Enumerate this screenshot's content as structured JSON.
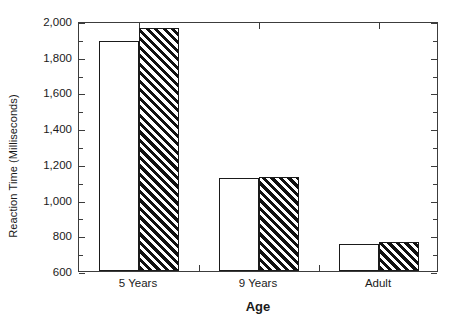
{
  "chart_data": {
    "type": "bar",
    "title": "",
    "subtitle": "",
    "xlabel": "Age",
    "ylabel": "Reaction Time (Milliseconds)",
    "categories": [
      "5 Years",
      "9 Years",
      "Adult"
    ],
    "series": [
      {
        "name": "open",
        "style": "white-open",
        "values": [
          1890,
          1120,
          750
        ]
      },
      {
        "name": "hatched",
        "style": "black-diagonal-hatch",
        "values": [
          1960,
          1125,
          765
        ]
      }
    ],
    "ylim": [
      600,
      2000
    ],
    "ytick_labels": [
      "600",
      "800",
      "1,000",
      "1,200",
      "1,400",
      "1,600",
      "1,800",
      "2,000"
    ],
    "ytick_values": [
      600,
      800,
      1000,
      1200,
      1400,
      1600,
      1800,
      2000
    ],
    "yminor_values": [
      700,
      900,
      1100,
      1300,
      1500,
      1700,
      1900
    ],
    "grid": false,
    "legend": "none",
    "frame": "box",
    "colors": {
      "axis": "#3c3c3c",
      "bar_edge": "#1a1a1a",
      "bar_open_fill": "#ffffff",
      "bar_hatch_fill": "#111111",
      "background": "#ffffff",
      "text": "#1a1a1a"
    }
  }
}
